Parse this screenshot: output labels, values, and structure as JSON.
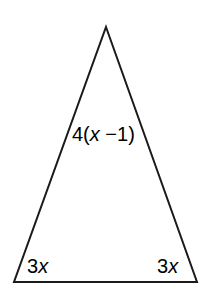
{
  "figure": {
    "type": "geometry-triangle-diagram",
    "shape_name": "isosceles-triangle",
    "stroke_color": "#1a1a1a",
    "fill_color": "#ffffff",
    "background_color": "#ffffff",
    "stroke_width": 2,
    "vertices": {
      "apex": {
        "x": 106,
        "y": 27
      },
      "bottom_left": {
        "x": 14,
        "y": 282
      },
      "bottom_right": {
        "x": 197,
        "y": 282
      }
    },
    "labels": {
      "left_side": {
        "prefix": "4(",
        "variable": "x",
        "suffix": " −1)",
        "full_text": "4(x −1)"
      },
      "left_base_angle": {
        "coefficient": "3",
        "variable": "x",
        "full_text": "3x"
      },
      "right_base_angle": {
        "coefficient": "3",
        "variable": "x",
        "full_text": "3x"
      }
    }
  }
}
